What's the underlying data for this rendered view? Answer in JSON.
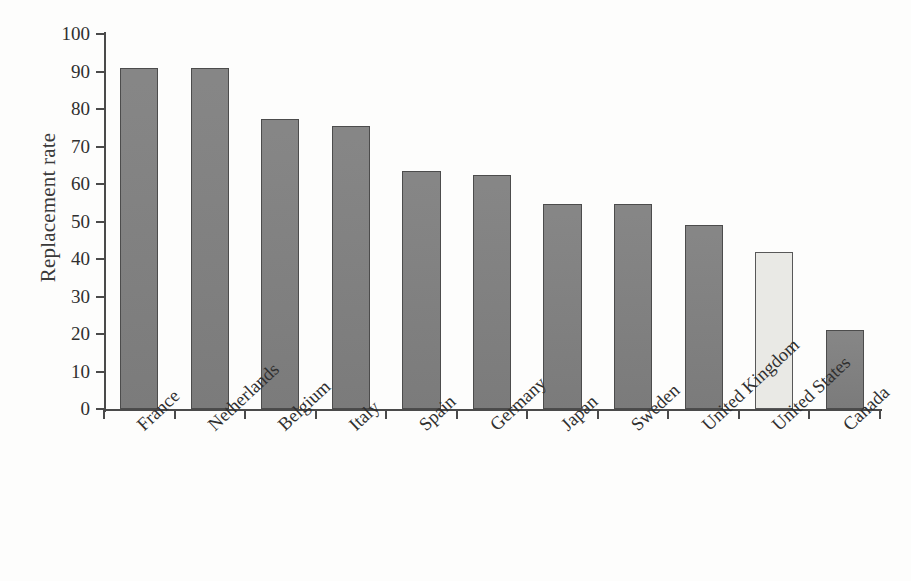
{
  "chart_data": {
    "type": "bar",
    "title": "",
    "xlabel": "",
    "ylabel": "Replacement rate",
    "ylim": [
      0,
      100
    ],
    "ytick_step": 10,
    "grid": false,
    "legend": "none",
    "categories": [
      "France",
      "Netherlands",
      "Belgium",
      "Italy",
      "Spain",
      "Germany",
      "Japan",
      "Sweden",
      "United Kingdom",
      "United States",
      "Canada"
    ],
    "values": [
      91,
      91,
      77.3,
      75.4,
      63.5,
      62.5,
      54.6,
      54.8,
      49,
      42,
      21
    ],
    "yticks": [
      "0",
      "10",
      "20",
      "30",
      "40",
      "50",
      "60",
      "70",
      "80",
      "90",
      "100"
    ],
    "highlight_category": "United States",
    "colors": {
      "bar_fill": "#808080",
      "bar_border": "#4c4c4c",
      "highlight_fill": "#e9e9e5",
      "highlight_border": "#585858",
      "axis": "#4a4a4a",
      "text": "#2f2f2f",
      "background": "#fdfdfc"
    }
  }
}
